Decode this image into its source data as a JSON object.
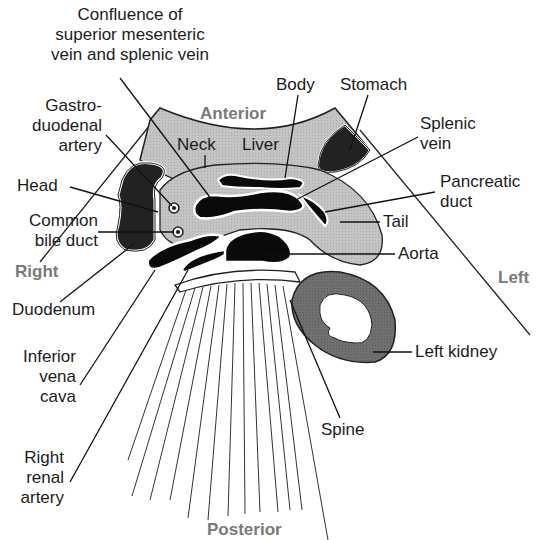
{
  "diagram": {
    "colors": {
      "background": "#ffffff",
      "liver": "#b4b4b4",
      "pancreas": "#c8c8c8",
      "vessels": "#0a0a0a",
      "stomach": "#222222",
      "duodenum": "#222222",
      "kidney": "#6e6e6e",
      "direction_text": "#7a7a7a",
      "label_text": "#1c1c1c"
    },
    "directions": {
      "anterior": "Anterior",
      "posterior": "Posterior",
      "right": "Right",
      "left": "Left"
    },
    "labels": {
      "confluence_1": "Confluence of",
      "confluence_2": "superior mesenteric",
      "confluence_3": "vein and splenic vein",
      "gastro_1": "Gastro-",
      "gastro_2": "duodenal",
      "gastro_3": "artery",
      "head": "Head",
      "cbd_1": "Common",
      "cbd_2": "bile duct",
      "duodenum": "Duodenum",
      "ivc_1": "Inferior",
      "ivc_2": "vena",
      "ivc_3": "cava",
      "rra_1": "Right",
      "rra_2": "renal",
      "rra_3": "artery",
      "neck": "Neck",
      "liver": "Liver",
      "body": "Body",
      "stomach": "Stomach",
      "splenic_1": "Splenic",
      "splenic_2": "vein",
      "pduct_1": "Pancreatic",
      "pduct_2": "duct",
      "tail": "Tail",
      "aorta": "Aorta",
      "left_kidney": "Left kidney",
      "spine": "Spine"
    }
  }
}
